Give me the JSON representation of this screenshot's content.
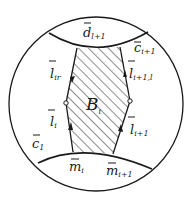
{
  "figure": {
    "colors": {
      "ink": "#1a1a1a",
      "background": "#ffffff"
    }
  },
  "labels": {
    "region": {
      "base": "B",
      "sub": "i"
    },
    "top_arc": {
      "base": "d",
      "sub": "l+1",
      "bar": true
    },
    "top_right_arc": {
      "base": "c",
      "sub": "i+1",
      "bar": true
    },
    "left_upper_edge": {
      "base": "l",
      "sub": "ir",
      "bar": true
    },
    "right_upper_edge": {
      "base": "l",
      "sub": "i+1,l",
      "bar": true
    },
    "left_lower_edge": {
      "base": "l",
      "sub": "i",
      "bar": true
    },
    "right_lower_edge": {
      "base": "l",
      "sub": "i+1",
      "bar": true
    },
    "bottom_left_arc": {
      "base": "c",
      "sub": "1",
      "bar": true
    },
    "bottom_point_left": {
      "base": "m",
      "sub": "i",
      "bar": true
    },
    "bottom_point_right": {
      "base": "m",
      "sub": "i+1",
      "bar": true
    }
  }
}
